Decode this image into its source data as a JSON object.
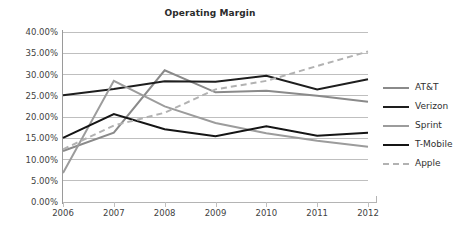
{
  "chart_data": {
    "type": "line",
    "title": "Operating Margin",
    "xlabel": "",
    "ylabel": "",
    "categories": [
      "2006",
      "2007",
      "2008",
      "2009",
      "2010",
      "2011",
      "2012"
    ],
    "ylim": [
      0,
      40
    ],
    "y_ticks": [
      0,
      5,
      10,
      15,
      20,
      25,
      30,
      35,
      40
    ],
    "y_tick_labels": [
      "0.00%",
      "5.00%",
      "10.00%",
      "15.00%",
      "20.00%",
      "25.00%",
      "30.00%",
      "35.00%",
      "40.00%"
    ],
    "grid": true,
    "legend_position": "right",
    "series": [
      {
        "name": "AT&T",
        "color": "#8a8a8a",
        "style": "solid",
        "width": 2,
        "values": [
          12.0,
          16.3,
          31.0,
          25.8,
          26.2,
          25.0,
          23.6
        ]
      },
      {
        "name": "Verizon",
        "color": "#1e1e1e",
        "style": "solid",
        "width": 2,
        "values": [
          25.1,
          26.6,
          28.4,
          28.3,
          29.7,
          26.5,
          28.9
        ]
      },
      {
        "name": "Sprint",
        "color": "#9c9c9c",
        "style": "solid",
        "width": 2,
        "values": [
          6.8,
          28.5,
          22.5,
          18.6,
          16.2,
          14.4,
          13.0
        ]
      },
      {
        "name": "T-Mobile",
        "color": "#151515",
        "style": "solid",
        "width": 2,
        "values": [
          15.1,
          20.7,
          17.1,
          15.5,
          17.8,
          15.6,
          16.3
        ]
      },
      {
        "name": "Apple",
        "color": "#b2b2b2",
        "style": "dashed",
        "width": 2,
        "values": [
          12.4,
          18.0,
          21.0,
          26.5,
          28.5,
          32.0,
          35.4
        ]
      }
    ]
  },
  "legend": {
    "items": [
      {
        "label": "AT&T"
      },
      {
        "label": "Verizon"
      },
      {
        "label": "Sprint"
      },
      {
        "label": "T-Mobile"
      },
      {
        "label": "Apple"
      }
    ]
  }
}
